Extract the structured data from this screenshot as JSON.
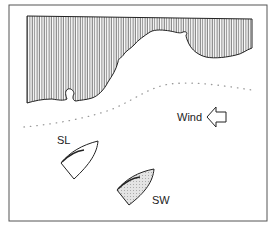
{
  "diagram": {
    "type": "sailing-situation",
    "labels": {
      "wind": "Wind",
      "boat_leeward": "SL",
      "boat_windward": "SW"
    },
    "elements": {
      "land": "hatched coastline (top)",
      "wind_arrow": "arrow pointing left",
      "dotted_line": "current/lay line"
    },
    "colors": {
      "line": "#222222",
      "hatch": "#444444",
      "sw_fill": "#d8d8d8",
      "background": "#ffffff"
    }
  }
}
